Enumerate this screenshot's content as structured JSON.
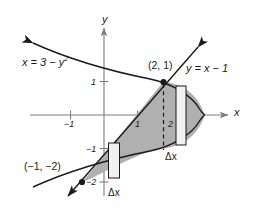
{
  "figure": {
    "kind": "calculus-area-between-curves-diagram",
    "axes": {
      "x_axis_label": "x",
      "y_axis_label": "y",
      "origin_px": [
        104,
        115
      ],
      "unit_px": 33.5,
      "x_ticks": [
        {
          "value": -1,
          "label": "−1",
          "px": 70.5
        },
        {
          "value": 1,
          "label": "1",
          "px": 137.5
        },
        {
          "value": 2,
          "label": "2",
          "px": 171
        }
      ],
      "y_ticks": [
        {
          "value": 1,
          "label": "1",
          "px": 81.5
        },
        {
          "value": -1,
          "label": "−1",
          "px": 148.5
        },
        {
          "value": -2,
          "label": "−2",
          "px": 182
        }
      ]
    },
    "curves": [
      {
        "name": "parabola",
        "label": "x = 3 − y",
        "label_sup": "2",
        "equation": "x = 3 - y^2",
        "vertex": [
          3,
          0
        ]
      },
      {
        "name": "line",
        "label": "y = x − 1",
        "equation": "y = x - 1",
        "slope": 1,
        "intercept": -1
      }
    ],
    "points": [
      {
        "label": "(2, 1)",
        "x": 2,
        "y": 1
      },
      {
        "label": "(−1, −2)",
        "x": -1,
        "y": -2
      }
    ],
    "strips": [
      {
        "name": "left-strip",
        "label": "Δx"
      },
      {
        "name": "right-strip",
        "label": "Δx"
      }
    ],
    "dashed_line": {
      "at_x": 2,
      "from_y": 0,
      "to_y": 1
    },
    "colors": {
      "region_fill": "#b0b0b0",
      "stroke": "#1a1a1a",
      "axis": "#7d7d7d",
      "strip_fill": "#f2f2f2"
    }
  }
}
